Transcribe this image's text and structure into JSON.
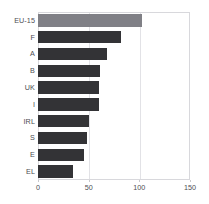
{
  "chart_data": {
    "type": "bar",
    "orientation": "horizontal",
    "title": "",
    "subtitle": "",
    "xlabel": "",
    "ylabel": "",
    "categories": [
      "EU-15",
      "F",
      "A",
      "B",
      "UK",
      "I",
      "IRL",
      "S",
      "E",
      "EL"
    ],
    "values": [
      103,
      82,
      68,
      61,
      60,
      60,
      50,
      48,
      45,
      35
    ],
    "series": [
      {
        "name": "",
        "values": [
          103,
          82,
          68,
          61,
          60,
          60,
          50,
          48,
          45,
          35
        ]
      }
    ],
    "xlim": [
      0,
      150
    ],
    "xticks": [
      0,
      50,
      100,
      150
    ],
    "xtick_labels": [
      "0",
      "50",
      "100",
      "150"
    ],
    "grid": true,
    "grid_axis": "x",
    "legend": false,
    "legend_position": "none",
    "bar_colors": [
      "#808086",
      "#333336",
      "#333336",
      "#333336",
      "#333336",
      "#333336",
      "#333336",
      "#333336",
      "#333336",
      "#333336"
    ],
    "highlight_category": "EU-15",
    "colors": {
      "bar_default": "#333336",
      "bar_highlight": "#808086",
      "axis_text": "#4d4d52",
      "gridline": "#e2e2e6",
      "frame": "#d8d8dc",
      "background": "#ffffff"
    }
  }
}
